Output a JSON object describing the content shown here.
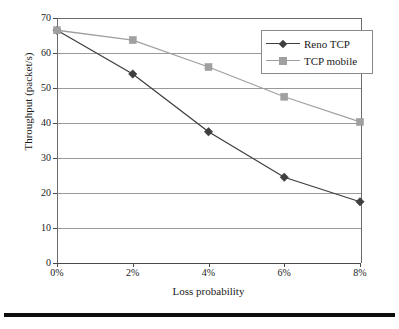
{
  "chart_data": {
    "type": "line",
    "title": "",
    "xlabel": "Loss probability",
    "ylabel": "Throughput (packet/s)",
    "categories": [
      "0%",
      "2%",
      "4%",
      "6%",
      "8%"
    ],
    "x": [
      0,
      2,
      4,
      6,
      8
    ],
    "xlim": [
      0,
      8
    ],
    "ylim": [
      0,
      70
    ],
    "yticks": [
      0,
      10,
      20,
      30,
      40,
      50,
      60,
      70
    ],
    "ytick_labels": [
      "0",
      "10",
      "20",
      "30",
      "40",
      "50",
      "60",
      "70"
    ],
    "xtick_labels": [
      "0%",
      "2%",
      "4%",
      "6%",
      "8%"
    ],
    "grid": "horizontal",
    "legend_position": "top-right",
    "series": [
      {
        "name": "Reno TCP",
        "values": [
          66.5,
          54.0,
          37.5,
          24.5,
          17.5
        ],
        "color": "#3f3f3f",
        "marker": "diamond"
      },
      {
        "name": "TCP mobile",
        "values": [
          66.5,
          63.7,
          56.0,
          47.5,
          40.3
        ],
        "color": "#a0a0a0",
        "marker": "square"
      }
    ]
  },
  "legend": {
    "items": [
      {
        "label": "Reno TCP"
      },
      {
        "label": "TCP mobile"
      }
    ]
  },
  "axes": {
    "y_title": "Throughput (packet/s)",
    "x_title": "Loss probability"
  },
  "colors": {
    "series_reno": "#3f3f3f",
    "series_mobile": "#a0a0a0",
    "gridline": "#9a9a9a",
    "axis": "#4a4a4a",
    "frame": "#6b6b6b",
    "footer_rule": "#0d0d0d",
    "background": "#ffffff",
    "text": "#1a1a1a"
  }
}
